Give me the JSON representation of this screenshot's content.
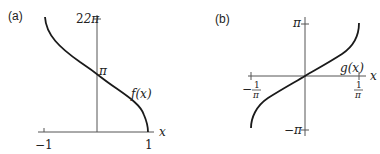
{
  "panels": [
    {
      "label": "(a)",
      "function_label": "f(x)",
      "x_axis_label": "x",
      "x_ticks": [
        "−1",
        "1"
      ],
      "y_ticks": [
        "2π",
        "π"
      ],
      "curve": {
        "x_range": [
          -1,
          1
        ],
        "points": [
          [
            -1,
            6.283
          ],
          [
            0,
            3.1416
          ],
          [
            1,
            0
          ]
        ]
      }
    },
    {
      "label": "(b)",
      "function_label": "g(x)",
      "x_axis_label": "x",
      "x_ticks_num": [
        "1",
        "1"
      ],
      "x_ticks_den": [
        "π",
        "π"
      ],
      "x_ticks_sign": [
        "−",
        ""
      ],
      "y_ticks": [
        "π",
        "−π"
      ],
      "curve": {
        "x_range": [
          -0.3183,
          0.3183
        ],
        "points": [
          [
            -0.3183,
            -3.1416
          ],
          [
            0,
            0
          ],
          [
            0.3183,
            3.1416
          ]
        ]
      }
    }
  ]
}
